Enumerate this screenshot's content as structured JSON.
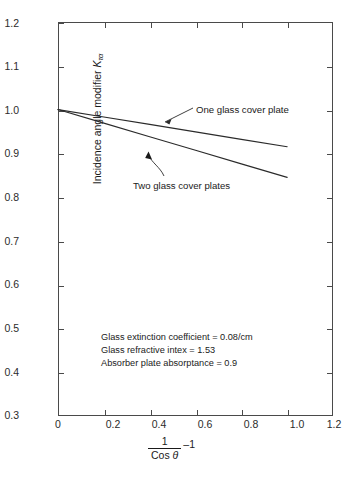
{
  "chart_data": {
    "type": "line",
    "title": "",
    "xlabel": "1 / Cos θ − 1",
    "ylabel": "Incidence angle modifier Kτα",
    "xlim": [
      0,
      1.2
    ],
    "ylim": [
      0.3,
      1.2
    ],
    "xticks": [
      0,
      0.2,
      0.4,
      0.6,
      0.8,
      1.0,
      1.2
    ],
    "xtick_labels": [
      "0",
      "0.2",
      "0.4",
      "0.6",
      "0.8",
      "1.0",
      "1.2"
    ],
    "yticks": [
      0.3,
      0.4,
      0.5,
      0.6,
      0.7,
      0.8,
      0.9,
      1.0,
      1.1,
      1.2
    ],
    "ytick_labels": [
      "0.3",
      "0.4",
      "0.5",
      "0.6",
      "0.7",
      "0.8",
      "0.9",
      "1.0",
      "1.1",
      "1.2"
    ],
    "grid": false,
    "legend": "inline-annotations",
    "series": [
      {
        "name": "One glass cover plate",
        "x": [
          0.0,
          0.2,
          0.4,
          0.6,
          0.8,
          1.0
        ],
        "values": [
          1.0,
          0.983,
          0.966,
          0.949,
          0.932,
          0.915
        ]
      },
      {
        "name": "Two glass cover plates",
        "x": [
          0.0,
          0.2,
          0.4,
          0.6,
          0.8,
          1.0
        ],
        "values": [
          1.0,
          0.969,
          0.938,
          0.907,
          0.876,
          0.845
        ]
      }
    ],
    "annotations": [
      "Glass extinction coefficient = 0.08/cm",
      "Glass refractive intex = 1.53",
      "Absorber plate absorptance = 0.9"
    ],
    "line_color": "#2b2b2b",
    "axis_color": "#4a4a4a"
  },
  "axis": {
    "y_title_main": "Incidence angle modifier ",
    "y_title_var": "K",
    "y_title_sub": "τα",
    "x_frac_numerator": "1",
    "x_frac_denominator_cos": "Cos ",
    "x_frac_denominator_theta": "θ",
    "x_minus_one": "–1"
  },
  "labels": {
    "one_glass": "One glass cover plate",
    "two_glass": "Two glass cover plates"
  },
  "notes": {
    "line1": "Glass extinction coefficient = 0.08/cm",
    "line2": "Glass refractive intex = 1.53",
    "line3": "Absorber plate absorptance = 0.9"
  },
  "ticks": {
    "y": [
      "1.2",
      "1.1",
      "1.0",
      "0.9",
      "0.8",
      "0.7",
      "0.6",
      "0.5",
      "0.4",
      "0.3"
    ],
    "x": [
      "0",
      "0.2",
      "0.4",
      "0.6",
      "0.8",
      "1.0",
      "1.2"
    ]
  }
}
